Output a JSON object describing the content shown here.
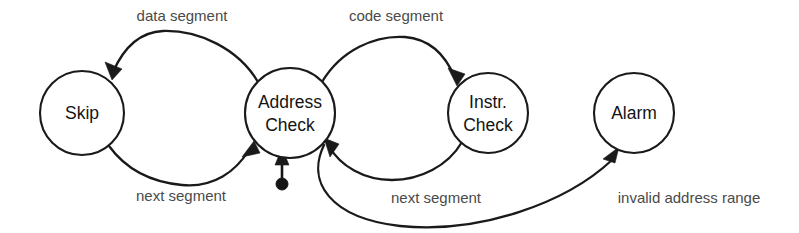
{
  "diagram": {
    "background_color": "#ffffff",
    "stroke_color": "#1a1a1a",
    "label_color": "#4a4a4a",
    "node_text_color": "#141414",
    "states": [
      {
        "id": "skip",
        "label_line1": "Skip",
        "label_line2": "",
        "cx": 82,
        "cy": 113,
        "r": 42
      },
      {
        "id": "address-check",
        "label_line1": "Address",
        "label_line2": "Check",
        "cx": 290,
        "cy": 113,
        "r": 45
      },
      {
        "id": "instr-check",
        "label_line1": "Instr.",
        "label_line2": "Check",
        "cx": 488,
        "cy": 113,
        "r": 40
      },
      {
        "id": "alarm",
        "label_line1": "Alarm",
        "label_line2": "",
        "cx": 634,
        "cy": 113,
        "r": 40
      }
    ],
    "initial_state": {
      "target": "address-check",
      "dot_x": 282,
      "dot_y": 184,
      "dot_r": 6
    },
    "transitions": [
      {
        "id": "data-segment",
        "label": "data segment",
        "from": "address-check",
        "to": "skip",
        "label_x": 182,
        "label_y": 17
      },
      {
        "id": "next-segment-skip",
        "label": "next segment",
        "from": "skip",
        "to": "address-check",
        "label_x": 181,
        "label_y": 197
      },
      {
        "id": "code-segment",
        "label": "code segment",
        "from": "address-check",
        "to": "instr-check",
        "label_x": 396,
        "label_y": 17
      },
      {
        "id": "next-segment-instr",
        "label": "next segment",
        "from": "instr-check",
        "to": "address-check",
        "label_x": 436,
        "label_y": 199
      },
      {
        "id": "invalid-address-range",
        "label": "invalid address range",
        "from": "address-check",
        "to": "alarm",
        "label_x": 689,
        "label_y": 199
      }
    ]
  }
}
